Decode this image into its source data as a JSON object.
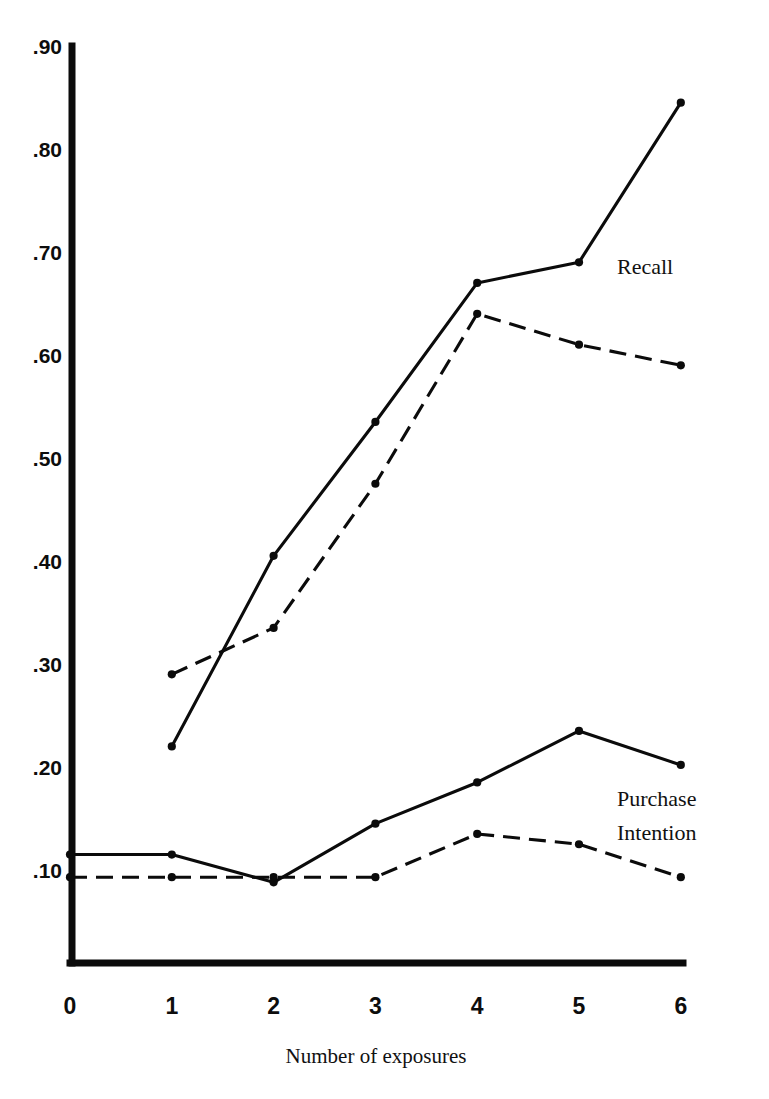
{
  "figure": {
    "top_cut_text": "",
    "background_color": "#ffffff",
    "ink_color": "#0b0b0b"
  },
  "chart_data": {
    "type": "line",
    "title": "",
    "subtitle": "",
    "xlabel": "Number of exposures",
    "ylabel": "",
    "xlim": [
      0,
      6
    ],
    "ylim": [
      0,
      0.9
    ],
    "grid": false,
    "legend_position": "inline-right",
    "x": [
      0,
      1,
      2,
      3,
      4,
      5,
      6
    ],
    "xtick_labels": [
      "0",
      "1",
      "2",
      "3",
      "4",
      "5",
      "6"
    ],
    "ytick_labels": [
      ".90",
      ".80",
      ".70",
      ".60",
      ".50",
      ".40",
      ".30",
      ".20",
      ".10"
    ],
    "ytick_values": [
      0.9,
      0.8,
      0.7,
      0.6,
      0.5,
      0.4,
      0.3,
      0.2,
      0.1
    ],
    "group_labels": [
      {
        "name": "Recall",
        "text": "Recall",
        "lines": [
          "Recall"
        ]
      },
      {
        "name": "Purchase Intention",
        "text": "Purchase Intention",
        "lines": [
          "Purchase",
          "Intention"
        ]
      }
    ],
    "series": [
      {
        "name": "Recall solid",
        "group": "Recall",
        "style": "solid",
        "x": [
          1,
          2,
          3,
          4,
          5,
          6
        ],
        "values": [
          0.22,
          0.405,
          0.535,
          0.67,
          0.69,
          0.845
        ]
      },
      {
        "name": "Recall dashed",
        "group": "Recall",
        "style": "dashed",
        "x": [
          1,
          2,
          3,
          4,
          5,
          6
        ],
        "values": [
          0.29,
          0.335,
          0.475,
          0.64,
          0.61,
          0.59
        ]
      },
      {
        "name": "Purchase Intention solid",
        "group": "Purchase Intention",
        "style": "solid",
        "x": [
          0,
          1,
          2,
          3,
          4,
          5,
          6
        ],
        "values": [
          0.115,
          0.115,
          0.088,
          0.145,
          0.185,
          0.235,
          0.202
        ]
      },
      {
        "name": "Purchase Intention dashed",
        "group": "Purchase Intention",
        "style": "dashed",
        "x": [
          0,
          1,
          2,
          3,
          4,
          5,
          6
        ],
        "values": [
          0.093,
          0.093,
          0.093,
          0.093,
          0.135,
          0.125,
          0.093
        ]
      }
    ]
  }
}
